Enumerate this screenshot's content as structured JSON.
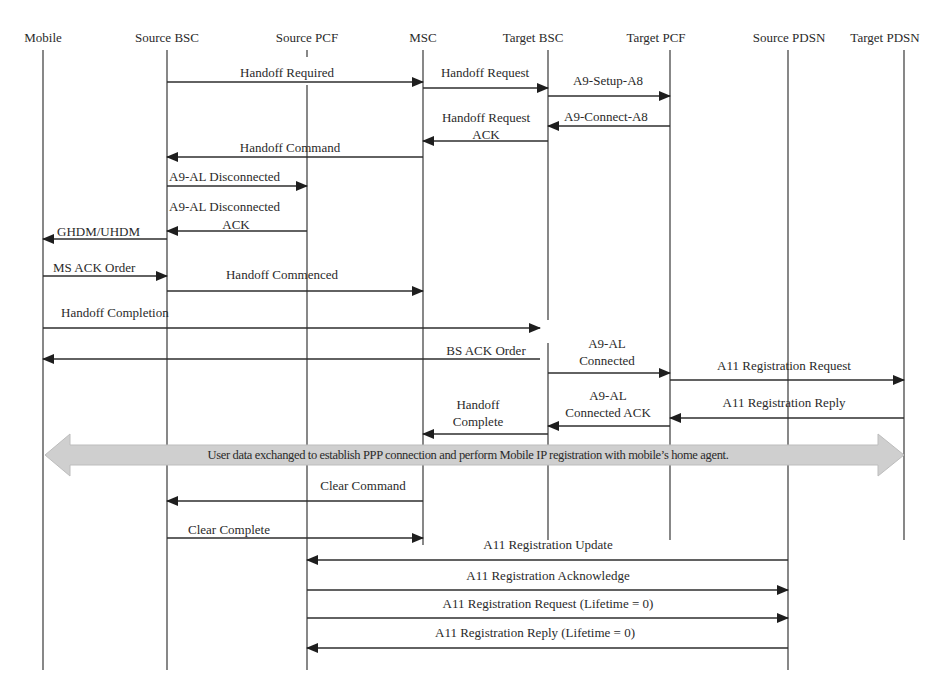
{
  "diagram": {
    "type": "sequence",
    "colors": {
      "line": "#3a3a3a",
      "band_fill": "#cfcfcf",
      "text": "#2a2a2a"
    },
    "participants": [
      {
        "id": "mobile",
        "label": "Mobile",
        "x": 43
      },
      {
        "id": "source_bsc",
        "label": "Source BSC",
        "x": 167
      },
      {
        "id": "source_pcf",
        "label": "Source PCF",
        "x": 307
      },
      {
        "id": "msc",
        "label": "MSC",
        "x": 423
      },
      {
        "id": "target_bsc",
        "label": "Target BSC",
        "x": 548
      },
      {
        "id": "target_pcf",
        "label": "Target PCF",
        "x": 670
      },
      {
        "id": "source_pdsn",
        "label": "Source PDSN",
        "x": 788
      },
      {
        "id": "target_pdsn",
        "label": "Target PDSN",
        "x": 904
      }
    ],
    "messages": [
      {
        "label": "Handoff Required",
        "from": "source_bsc",
        "to": "msc",
        "y": 82
      },
      {
        "label": "Handoff Request",
        "from": "msc",
        "to": "target_bsc",
        "y": 88
      },
      {
        "label": "A9-Setup-A8",
        "from": "target_bsc",
        "to": "target_pcf",
        "y": 96
      },
      {
        "label": "A9-Connect-A8",
        "from": "target_pcf",
        "to": "target_bsc",
        "y": 126
      },
      {
        "label": "Handoff Request ACK",
        "from": "target_bsc",
        "to": "msc",
        "y": 141
      },
      {
        "label": "Handoff Command",
        "from": "msc",
        "to": "source_bsc",
        "y": 157
      },
      {
        "label": "A9-AL Disconnected",
        "from": "source_bsc",
        "to": "source_pcf",
        "y": 186
      },
      {
        "label": "A9-AL Disconnected ACK",
        "from": "source_pcf",
        "to": "source_bsc",
        "y": 231
      },
      {
        "label": "GHDM/UHDM",
        "from": "source_bsc",
        "to": "mobile",
        "y": 239
      },
      {
        "label": "MS ACK Order",
        "from": "mobile",
        "to": "source_bsc",
        "y": 276
      },
      {
        "label": "Handoff Commenced",
        "from": "source_bsc",
        "to": "msc",
        "y": 291
      },
      {
        "label": "Handoff Completion",
        "from": "mobile",
        "to": "target_bsc",
        "y": 328
      },
      {
        "label": "BS ACK Order",
        "from": "target_bsc",
        "to": "mobile",
        "y": 359
      },
      {
        "label": "A9-AL Connected",
        "from": "target_bsc",
        "to": "target_pcf",
        "y": 373
      },
      {
        "label": "A11 Registration Request",
        "from": "target_pcf",
        "to": "target_pdsn",
        "y": 380
      },
      {
        "label": "A11 Registration Reply",
        "from": "target_pdsn",
        "to": "target_pcf",
        "y": 418
      },
      {
        "label": "A9-AL Connected ACK",
        "from": "target_pcf",
        "to": "target_bsc",
        "y": 426
      },
      {
        "label": "Handoff Complete",
        "from": "target_bsc",
        "to": "msc",
        "y": 434
      },
      {
        "label": "Clear Command",
        "from": "msc",
        "to": "source_bsc",
        "y": 501
      },
      {
        "label": "Clear Complete",
        "from": "source_bsc",
        "to": "msc",
        "y": 538
      },
      {
        "label": "A11 Registration Update",
        "from": "source_pdsn",
        "to": "source_pcf",
        "y": 560
      },
      {
        "label": "A11 Registration Acknowledge",
        "from": "source_pcf",
        "to": "source_pdsn",
        "y": 590
      },
      {
        "label": "A11 Registration Request (Lifetime = 0)",
        "from": "source_pcf",
        "to": "source_pdsn",
        "y": 618
      },
      {
        "label": "A11 Registration Reply (Lifetime = 0)",
        "from": "source_pdsn",
        "to": "source_pcf",
        "y": 648
      }
    ],
    "band": {
      "label": "User data exchanged to establish PPP connection and perform Mobile IP registration with mobile’s home agent.",
      "from": "mobile",
      "to": "target_pdsn",
      "y": 455,
      "bidirectional": true
    },
    "labels": {
      "p_mobile": "Mobile",
      "p_source_bsc": "Source BSC",
      "p_source_pcf": "Source PCF",
      "p_msc": "MSC",
      "p_target_bsc": "Target BSC",
      "p_target_pcf": "Target PCF",
      "p_source_pdsn": "Source PDSN",
      "p_target_pdsn": "Target PDSN",
      "m_handoff_required": "Handoff Required",
      "m_handoff_request": "Handoff Request",
      "m_a9_setup": "A9-Setup-A8",
      "m_a9_connect": "A9-Connect-A8",
      "m_handoff_request_ack_1": "Handoff Request",
      "m_handoff_request_ack_2": "ACK",
      "m_handoff_command": "Handoff Command",
      "m_a9_al_disc": "A9-AL Disconnected",
      "m_a9_al_disc_ack_1": "A9-AL Disconnected",
      "m_a9_al_disc_ack_2": "ACK",
      "m_ghdm": "GHDM/UHDM",
      "m_ms_ack": "MS ACK Order",
      "m_handoff_commenced": "Handoff Commenced",
      "m_handoff_completion": "Handoff Completion",
      "m_bs_ack": "BS ACK Order",
      "m_a9_al_conn_1": "A9-AL",
      "m_a9_al_conn_2": "Connected",
      "m_a11_req": "A11 Registration Request",
      "m_a11_reply": "A11 Registration Reply",
      "m_a9_al_conn_ack_1": "A9-AL",
      "m_a9_al_conn_ack_2": "Connected ACK",
      "m_handoff_complete_1": "Handoff",
      "m_handoff_complete_2": "Complete",
      "band": "User data exchanged to establish PPP connection and perform Mobile IP registration with mobile’s home agent.",
      "m_clear_command": "Clear Command",
      "m_clear_complete": "Clear Complete",
      "m_a11_update": "A11 Registration Update",
      "m_a11_ack": "A11 Registration Acknowledge",
      "m_a11_req_0": "A11 Registration Request (Lifetime = 0)",
      "m_a11_reply_0": "A11 Registration Reply (Lifetime = 0)"
    }
  }
}
